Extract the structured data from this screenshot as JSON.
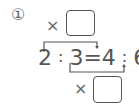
{
  "problem": {
    "number_label": "①",
    "top_operator": "×",
    "bottom_operator": "×",
    "top_answer_box": "",
    "bottom_answer_box": "",
    "equation": {
      "a": "2",
      "sep1": ":",
      "b": "3",
      "equals": "=",
      "c": "4",
      "sep2": ":",
      "d": "6"
    }
  }
}
